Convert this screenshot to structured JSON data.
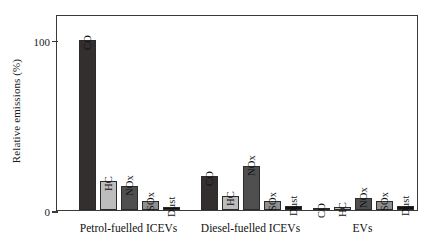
{
  "chart_data": {
    "type": "bar",
    "title": "",
    "xlabel": "",
    "ylabel": "Relative emissions (%)",
    "ylim": [
      0,
      115
    ],
    "yticks": [
      0,
      100
    ],
    "ytick_labels": [
      "0",
      "100"
    ],
    "grid": false,
    "legend": "none (bars labelled in-place)",
    "categories": [
      "Petrol-fuelled ICEVs",
      "Diesel-fuelled ICEVs",
      "EVs"
    ],
    "series_names": [
      "CO",
      "HC",
      "NOx",
      "SOx",
      "Dust"
    ],
    "series": [
      {
        "name": "CO",
        "values": [
          100,
          20,
          1
        ]
      },
      {
        "name": "HC",
        "values": [
          17,
          8,
          2
        ]
      },
      {
        "name": "NOx",
        "values": [
          14,
          26,
          7
        ]
      },
      {
        "name": "SOx",
        "values": [
          5,
          5,
          5
        ]
      },
      {
        "name": "Dust",
        "values": [
          1.5,
          2.5,
          2.5
        ]
      }
    ],
    "groups": [
      {
        "label": "Petrol-fuelled ICEVs",
        "bars": [
          {
            "label": "CO",
            "value": 100,
            "color": "#332f2f"
          },
          {
            "label": "HC",
            "value": 17,
            "color": "#bdbdbd"
          },
          {
            "label": "NOx",
            "value": 14,
            "color": "#4f4f4f"
          },
          {
            "label": "SOx",
            "value": 5,
            "color": "#8f8f8f"
          },
          {
            "label": "Dust",
            "value": 1.5,
            "color": "#111111"
          }
        ]
      },
      {
        "label": "Diesel-fuelled ICEVs",
        "bars": [
          {
            "label": "CO",
            "value": 20,
            "color": "#332f2f"
          },
          {
            "label": "HC",
            "value": 8,
            "color": "#bdbdbd"
          },
          {
            "label": "NOx",
            "value": 26,
            "color": "#4f4f4f"
          },
          {
            "label": "SOx",
            "value": 5,
            "color": "#8f8f8f"
          },
          {
            "label": "Dust",
            "value": 2.5,
            "color": "#111111"
          }
        ]
      },
      {
        "label": "EVs",
        "bars": [
          {
            "label": "CO",
            "value": 1,
            "color": "#332f2f"
          },
          {
            "label": "HC",
            "value": 2,
            "color": "#bdbdbd"
          },
          {
            "label": "NOx",
            "value": 7,
            "color": "#4f4f4f"
          },
          {
            "label": "SOx",
            "value": 5,
            "color": "#8f8f8f"
          },
          {
            "label": "Dust",
            "value": 2.5,
            "color": "#111111"
          }
        ]
      }
    ]
  },
  "axis": {
    "ylabel": "Relative emissions (%)",
    "tick_100": "100",
    "tick_0": "0"
  }
}
